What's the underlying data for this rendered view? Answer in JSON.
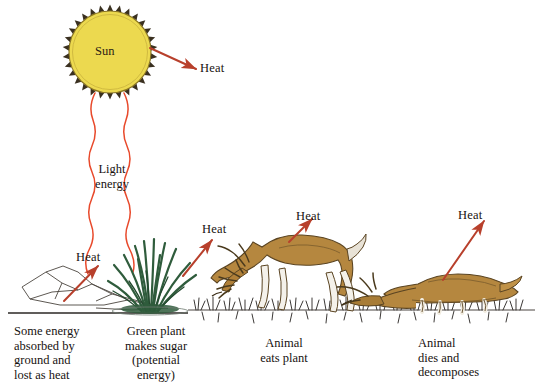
{
  "diagram": {
    "background_color": "#ffffff",
    "sun": {
      "label": "Sun",
      "fill_color": "#ecd94f",
      "outline_color": "#8a7520",
      "spike_color": "#3a3020"
    },
    "colors": {
      "heat_arrow": "#b8402c",
      "light_ray": "#e8492b",
      "grass_green": "#2f5c3c",
      "animal_brown": "#b5873f",
      "line_art": "#3c3732"
    },
    "light_energy_label": "Light\nenergy",
    "light_energy_line1": "Light",
    "light_energy_line2": "energy",
    "heat_labels": [
      {
        "id": "heat-sun",
        "text": "Heat"
      },
      {
        "id": "heat-ground",
        "text": "Heat"
      },
      {
        "id": "heat-plant",
        "text": "Heat"
      },
      {
        "id": "heat-deer",
        "text": "Heat"
      },
      {
        "id": "heat-dead",
        "text": "Heat"
      }
    ],
    "stages": [
      {
        "id": "ground",
        "caption_lines": [
          "Some energy",
          "absorbed by",
          "ground and",
          "lost as heat"
        ],
        "align": "left"
      },
      {
        "id": "plant",
        "caption_lines": [
          "Green plant",
          "makes sugar",
          "(potential",
          "energy)"
        ],
        "align": "center"
      },
      {
        "id": "herbivore",
        "caption_lines": [
          "Animal",
          "eats plant"
        ],
        "align": "center"
      },
      {
        "id": "decomposition",
        "caption_lines": [
          "Animal",
          "dies and",
          "decomposes"
        ],
        "align": "left"
      }
    ]
  }
}
